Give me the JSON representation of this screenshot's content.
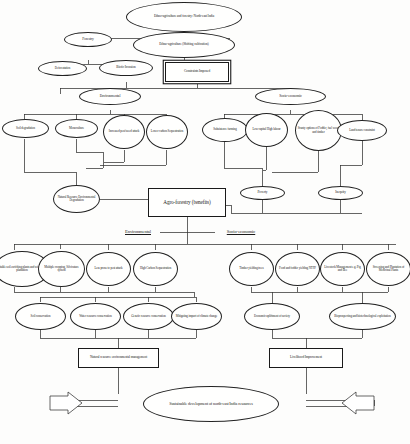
{
  "diagram": {
    "type": "flowchart",
    "nodes": {
      "root": "Ethno-agriculture and forestry: North-east India",
      "forestry": "Forestry",
      "ethno_agri": "Ethno-agriculture (Shifting cultivation)",
      "deforestation": "Deforestation",
      "biotic_invasion": "Biotic Invasion",
      "constraints": "Constraints Imposed",
      "environmental_top": "Environmental",
      "socio_economic_top": "Socio-economic",
      "soil_degradation": "Soil degradation",
      "monoculture": "Monoculture",
      "pest_attack": "Increased pest/weed attack",
      "lower_carbon": "Lower carbon Sequestration",
      "subsistence": "Subsistence farming",
      "low_capital": "Low capital High labour",
      "scanty_options": "Scanty options of Fodder, fuel wood and timber",
      "land_tenure": "Land tenure constraint",
      "nat_res_degradation": "Natural Resource Environmental Degradation",
      "poverty": "Poverty",
      "inequity": "Inequity",
      "agroforestry": "Agro-forestry (benefits)",
      "environmental_label": "Environmental",
      "socio_economic_label": "Socio-economic",
      "env_b1": "Suitable soil enriching plants and wind break plantation",
      "env_b2": "Multiple cropping, Silvicature system",
      "env_b3": "Less prone to pest attack",
      "env_b4": "High Carbon Sequestration",
      "soc_b1": "Timber yielding trees",
      "soc_b2": "Food and fodder yielding NTFP",
      "soc_b3": "Livestock Management e.g. Pig and Bee",
      "soc_b4": "Screening and Plantation of Medicinal Plants",
      "env_c1": "Soil conservation",
      "env_c2": "Water resource conservation",
      "env_c3": "Genetic resource conservation",
      "env_c4": "Mitigating impact of climate change",
      "soc_c1": "Economic upliftment of society",
      "soc_c2": "Bioprospecting and biotechnological exploitation",
      "nat_res_mgmt": "Natural resource environmental management",
      "livelihood": "Livelihood Improvement",
      "sustainable": "Sustainable development of north-east India resources"
    },
    "colors": {
      "stroke": "#222222",
      "text": "#1b1b1b",
      "background": "#fdfdfc"
    }
  }
}
